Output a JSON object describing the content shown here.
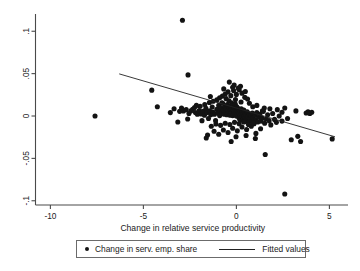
{
  "chart_data": {
    "type": "scatter",
    "title": "",
    "subtitle": "",
    "xlabel": "Change in relative service productivity",
    "ylabel": "",
    "xlim": [
      -10.8,
      6.0
    ],
    "ylim": [
      -0.105,
      0.118
    ],
    "xticks": [
      -10,
      -5,
      0,
      5
    ],
    "xticklabels": [
      "-10",
      "-5",
      "0",
      "5"
    ],
    "yticks": [
      0.1,
      0.05,
      0,
      -0.05,
      -0.1
    ],
    "yticklabels": [
      ".1",
      ".05",
      "0",
      "-.05",
      "-.1"
    ],
    "grid": false,
    "legend_position": "below-plot",
    "legend": [
      {
        "name": "Change in serv. emp. share",
        "marker": "circle",
        "color": "#131313"
      },
      {
        "name": "Fitted values",
        "marker": "line",
        "color": "#222222"
      }
    ],
    "series": [
      {
        "name": "Change in serv. emp. share",
        "marker": "circle",
        "color": "#131313",
        "points": [
          [
            -2.9,
            0.113
          ],
          [
            -7.6,
            0.0
          ],
          [
            -4.55,
            0.0305
          ],
          [
            -2.6,
            0.0485
          ],
          [
            -4.25,
            0.011
          ],
          [
            -3.55,
            0.004
          ],
          [
            -3.05,
            0.0055
          ],
          [
            -2.85,
            0.006
          ],
          [
            -2.7,
            0.0075
          ],
          [
            -2.55,
            0.003
          ],
          [
            -2.35,
            0.008
          ],
          [
            -2.2,
            0.004
          ],
          [
            -2.1,
            0.002
          ],
          [
            -2.0,
            0.0065
          ],
          [
            -1.9,
            0.0025
          ],
          [
            -1.8,
            0.0055
          ],
          [
            -1.72,
            0.001
          ],
          [
            -1.64,
            0.009
          ],
          [
            -1.58,
            0.004
          ],
          [
            -1.5,
            -0.003
          ],
          [
            -1.44,
            0.006
          ],
          [
            -1.38,
            0.0015
          ],
          [
            -1.3,
            0.0105
          ],
          [
            -1.24,
            0.0045
          ],
          [
            -1.18,
            0.002
          ],
          [
            -1.12,
            -0.0055
          ],
          [
            -1.05,
            0.008
          ],
          [
            -1.0,
            0.0035
          ],
          [
            -0.95,
            0.0125
          ],
          [
            -0.9,
            0.0005
          ],
          [
            -0.86,
            0.006
          ],
          [
            -0.82,
            0.0095
          ],
          [
            -0.78,
            0.003
          ],
          [
            -0.74,
            0.015
          ],
          [
            -0.7,
            0.007
          ],
          [
            -0.66,
            0.002
          ],
          [
            -0.62,
            0.011
          ],
          [
            -0.58,
            0.0045
          ],
          [
            -0.55,
            0.0085
          ],
          [
            -0.52,
            0.0015
          ],
          [
            -0.49,
            0.0135
          ],
          [
            -0.46,
            0.006
          ],
          [
            -0.43,
            0.003
          ],
          [
            -0.4,
            0.018
          ],
          [
            -0.38,
            0.009
          ],
          [
            -0.36,
            0.005
          ],
          [
            -0.34,
            0.001
          ],
          [
            -0.32,
            0.0115
          ],
          [
            -0.3,
            0.007
          ],
          [
            -0.28,
            0.0035
          ],
          [
            -0.26,
            0.0155
          ],
          [
            -0.24,
            0.0085
          ],
          [
            -0.22,
            0.0045
          ],
          [
            -0.2,
            0.0005
          ],
          [
            -0.18,
            0.0125
          ],
          [
            -0.16,
            0.0065
          ],
          [
            -0.14,
            0.003
          ],
          [
            -0.12,
            0.01
          ],
          [
            -0.1,
            0.0055
          ],
          [
            -0.08,
            0.0015
          ],
          [
            -0.06,
            0.014
          ],
          [
            -0.04,
            0.008
          ],
          [
            -0.02,
            0.004
          ],
          [
            0.0,
            0.0
          ],
          [
            0.02,
            0.011
          ],
          [
            0.04,
            0.006
          ],
          [
            0.06,
            0.002
          ],
          [
            0.08,
            0.009
          ],
          [
            0.1,
            0.0045
          ],
          [
            0.12,
            -0.0015
          ],
          [
            0.14,
            0.0075
          ],
          [
            0.16,
            0.0025
          ],
          [
            0.18,
            -0.004
          ],
          [
            0.2,
            0.006
          ],
          [
            0.22,
            0.001
          ],
          [
            0.24,
            -0.0025
          ],
          [
            0.26,
            0.0085
          ],
          [
            0.28,
            0.0035
          ],
          [
            0.3,
            -0.001
          ],
          [
            0.32,
            0.0055
          ],
          [
            0.34,
            -0.005
          ],
          [
            0.36,
            0.002
          ],
          [
            0.38,
            -0.003
          ],
          [
            0.4,
            0.007
          ],
          [
            0.42,
            0.0
          ],
          [
            0.44,
            -0.0065
          ],
          [
            0.46,
            0.004
          ],
          [
            0.48,
            -0.002
          ],
          [
            0.5,
            0.0015
          ],
          [
            0.54,
            -0.0045
          ],
          [
            0.58,
            0.005
          ],
          [
            0.62,
            -0.001
          ],
          [
            0.66,
            -0.0075
          ],
          [
            0.7,
            0.0025
          ],
          [
            0.74,
            -0.0035
          ],
          [
            0.78,
            0.0005
          ],
          [
            0.82,
            -0.0055
          ],
          [
            0.86,
            0.0035
          ],
          [
            0.9,
            -0.002
          ],
          [
            0.95,
            -0.009
          ],
          [
            1.0,
            0.001
          ],
          [
            1.05,
            -0.0045
          ],
          [
            1.1,
            0.004
          ],
          [
            1.15,
            -0.007
          ],
          [
            1.2,
            -0.0015
          ],
          [
            1.26,
            0.002
          ],
          [
            1.32,
            -0.006
          ],
          [
            1.38,
            -0.0025
          ],
          [
            1.45,
            0.0055
          ],
          [
            1.52,
            -0.0085
          ],
          [
            1.6,
            -0.0035
          ],
          [
            1.68,
            0.0015
          ],
          [
            1.76,
            -0.0055
          ],
          [
            1.85,
            -0.0105
          ],
          [
            1.95,
            0.003
          ],
          [
            2.05,
            -0.004
          ],
          [
            2.15,
            -0.0075
          ],
          [
            2.3,
            0.0
          ],
          [
            2.45,
            -0.006
          ],
          [
            2.6,
            0.0095
          ],
          [
            2.75,
            -0.003
          ],
          [
            2.95,
            -0.028
          ],
          [
            3.2,
            0.006
          ],
          [
            3.45,
            -0.03
          ],
          [
            3.75,
            0.0035
          ],
          [
            3.85,
            0.005
          ],
          [
            3.95,
            0.003
          ],
          [
            4.05,
            0.0045
          ],
          [
            3.3,
            -0.024
          ],
          [
            5.15,
            -0.027
          ],
          [
            2.6,
            -0.092
          ],
          [
            1.55,
            -0.0455
          ],
          [
            -0.6,
            0.026
          ],
          [
            -0.45,
            0.0285
          ],
          [
            -0.3,
            0.024
          ],
          [
            -0.15,
            0.03
          ],
          [
            0.0,
            0.0255
          ],
          [
            0.15,
            0.031
          ],
          [
            -0.75,
            0.0235
          ],
          [
            -0.9,
            0.0215
          ],
          [
            0.3,
            0.027
          ],
          [
            0.45,
            0.022
          ],
          [
            -1.05,
            0.019
          ],
          [
            0.6,
            0.02
          ],
          [
            -0.2,
            0.034
          ],
          [
            0.1,
            0.033
          ],
          [
            -0.55,
            0.0205
          ],
          [
            -1.55,
            -0.0225
          ],
          [
            -1.2,
            -0.018
          ],
          [
            -0.95,
            -0.0215
          ],
          [
            -0.7,
            -0.0165
          ],
          [
            -0.45,
            -0.0195
          ],
          [
            -0.2,
            -0.0145
          ],
          [
            0.05,
            -0.0175
          ],
          [
            0.3,
            -0.013
          ],
          [
            0.55,
            -0.016
          ],
          [
            0.8,
            -0.012
          ],
          [
            1.05,
            -0.0205
          ],
          [
            1.3,
            -0.015
          ],
          [
            -1.35,
            -0.012
          ],
          [
            -1.1,
            -0.0095
          ],
          [
            -0.85,
            -0.011
          ],
          [
            -0.6,
            -0.0085
          ],
          [
            -0.35,
            -0.01
          ],
          [
            -0.1,
            -0.0075
          ],
          [
            0.15,
            -0.009
          ],
          [
            0.4,
            -0.007
          ],
          [
            0.65,
            -0.01
          ],
          [
            0.9,
            -0.008
          ],
          [
            -1.45,
            0.016
          ],
          [
            -1.7,
            0.0135
          ],
          [
            -1.95,
            0.0115
          ],
          [
            -2.25,
            0.01
          ],
          [
            -2.45,
            0.006
          ],
          [
            -1.25,
            0.0175
          ],
          [
            -0.05,
            0.0195
          ],
          [
            0.25,
            0.0165
          ],
          [
            0.7,
            0.015
          ],
          [
            1.1,
            0.0125
          ],
          [
            1.5,
            0.0095
          ],
          [
            -1.62,
            -0.026
          ],
          [
            -0.02,
            -0.0245
          ],
          [
            0.52,
            -0.023
          ],
          [
            1.02,
            -0.0265
          ],
          [
            -3.35,
            0.0085
          ],
          [
            -2.95,
            0.0095
          ],
          [
            -2.15,
            0.0125
          ],
          [
            -1.85,
            -0.0055
          ],
          [
            -2.62,
            -0.0035
          ],
          [
            -3.15,
            -0.007
          ],
          [
            -0.38,
            0.04
          ],
          [
            -0.12,
            0.0365
          ],
          [
            0.22,
            0.035
          ],
          [
            -0.68,
            0.032
          ],
          [
            0.48,
            0.029
          ],
          [
            2.2,
            0.0075
          ],
          [
            2.45,
            0.0045
          ],
          [
            1.8,
            0.0085
          ],
          [
            1.4,
            0.006
          ],
          [
            -1.4,
            0.023
          ],
          [
            -0.78,
            0.0155
          ],
          [
            0.88,
            0.011
          ],
          [
            -0.28,
            -0.03
          ]
        ]
      },
      {
        "name": "Fitted values",
        "marker": "line",
        "color": "#222222",
        "x": [
          -6.3,
          5.3
        ],
        "y": [
          0.0497,
          -0.0245
        ],
        "slope": -0.0064,
        "intercept": 0.0093
      }
    ]
  }
}
